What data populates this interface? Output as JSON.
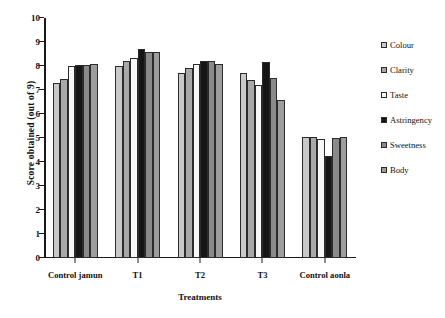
{
  "chart_data": {
    "type": "bar",
    "title": "",
    "xlabel": "Treatments",
    "ylabel": "Score obtained (out of 9)",
    "ylim": [
      0,
      10
    ],
    "ytick_step": 1,
    "yticks": [
      0,
      1,
      2,
      3,
      4,
      5,
      6,
      7,
      8,
      9,
      10
    ],
    "grid": false,
    "legend_position": "right",
    "categories": [
      "Control jamun",
      "T1",
      "T2",
      "T3",
      "Control aonla"
    ],
    "series": [
      {
        "name": "Colour",
        "color": "#c9c9c9",
        "values": [
          7.3,
          8.0,
          7.7,
          7.7,
          5.05
        ]
      },
      {
        "name": "Clarity",
        "color": "#a8a8a8",
        "values": [
          7.45,
          8.2,
          7.9,
          7.4,
          5.05
        ]
      },
      {
        "name": "Taste",
        "color": "#f7f7f7",
        "values": [
          8.0,
          8.35,
          8.1,
          7.2,
          4.95
        ]
      },
      {
        "name": "Astringency",
        "color": "#161616",
        "values": [
          8.05,
          8.7,
          8.2,
          8.15,
          4.25
        ]
      },
      {
        "name": "Sweetness",
        "color": "#8a8a8a",
        "values": [
          8.05,
          8.6,
          8.2,
          7.5,
          5.0
        ]
      },
      {
        "name": "Body",
        "color": "#9d9d9d",
        "values": [
          8.1,
          8.6,
          8.1,
          6.6,
          5.05
        ]
      }
    ]
  }
}
